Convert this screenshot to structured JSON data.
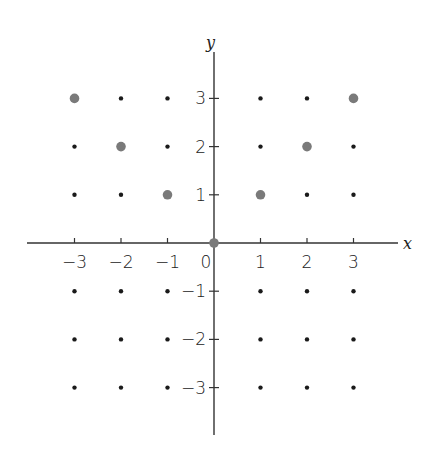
{
  "chart_data": {
    "type": "scatter",
    "title": "",
    "xlabel": "x",
    "ylabel": "y",
    "xlim": [
      -3,
      3
    ],
    "ylim": [
      -3,
      3
    ],
    "grid": false,
    "x_ticks": [
      -3,
      -2,
      -1,
      0,
      1,
      2,
      3
    ],
    "y_ticks": [
      3,
      2,
      1,
      -1,
      -2,
      -3
    ],
    "x_tick_labels": [
      "−3",
      "−2",
      "−1",
      "0",
      "1",
      "2",
      "3"
    ],
    "y_tick_labels": [
      "3",
      "2",
      "1",
      "−1",
      "−2",
      "−3"
    ],
    "series": [
      {
        "name": "integer lattice points",
        "style": "small black dot",
        "color": "#1a1a1a",
        "points": "all (x, y) with x, y in {-3,...,3}, excluding highlighted"
      },
      {
        "name": "highlighted points (y = |x|)",
        "style": "large gray dot",
        "color": "#7a7a7a",
        "points": [
          [
            -3,
            3
          ],
          [
            -2,
            2
          ],
          [
            -1,
            1
          ],
          [
            0,
            0
          ],
          [
            1,
            1
          ],
          [
            2,
            2
          ],
          [
            3,
            3
          ]
        ]
      }
    ]
  },
  "axes": {
    "x_label": "x",
    "y_label": "y"
  }
}
